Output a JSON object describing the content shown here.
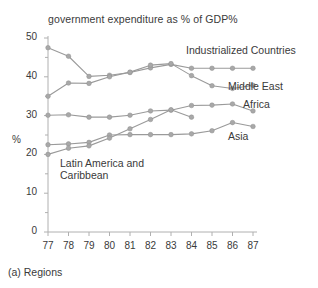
{
  "chart_data": {
    "type": "line",
    "title": "government expenditure as % of GDP%",
    "caption": "(a) Regions",
    "xlabel": "",
    "ylabel": "%",
    "x": [
      77,
      78,
      79,
      80,
      81,
      82,
      83,
      84,
      85,
      86,
      87
    ],
    "xtick_labels": [
      "77",
      "78",
      "79",
      "80",
      "81",
      "82",
      "83",
      "84",
      "85",
      "86",
      "87"
    ],
    "ytick_labels": [
      "0",
      "10",
      "20",
      "30",
      "40",
      "50"
    ],
    "yticks": [
      0,
      10,
      20,
      30,
      40,
      50
    ],
    "ylim": [
      0,
      50
    ],
    "xlim": [
      77,
      87
    ],
    "grid": false,
    "legend_position": "inline-right",
    "marker": "circle",
    "line_color": "#9a9a9a",
    "marker_color": "#a8a8a8",
    "axis_color": "#b0b0b0",
    "text_color": "#3a3a3a",
    "series": [
      {
        "name": "Industrialized Countries",
        "x": [
          77,
          78,
          79,
          80,
          81,
          82,
          83,
          84,
          85,
          86,
          87
        ],
        "values": [
          47.5,
          45.3,
          40.1,
          40.4,
          41.1,
          42.3,
          43.2,
          42.2,
          42.2,
          42.2,
          42.2
        ],
        "label_x": 87,
        "label_y": 46.5
      },
      {
        "name": "Middle East",
        "x": [
          77,
          78,
          79,
          80,
          81,
          82,
          83,
          84,
          85,
          86,
          87
        ],
        "values": [
          35.0,
          38.4,
          38.3,
          40.0,
          41.2,
          43.0,
          43.4,
          40.3,
          37.7,
          37.0,
          37.8
        ],
        "label_x": 87,
        "label_y": 38.8
      },
      {
        "name": "Africa",
        "x": [
          77,
          78,
          79,
          80,
          81,
          82,
          83,
          84,
          85,
          86,
          87
        ],
        "values": [
          30.1,
          30.2,
          29.6,
          29.6,
          30.1,
          31.2,
          31.4,
          32.6,
          32.7,
          33.0,
          31.2
        ],
        "label_x": 87,
        "label_y": 34.5
      },
      {
        "name": "Asia",
        "x": [
          77,
          78,
          79,
          80,
          81,
          82,
          83,
          84,
          85,
          86,
          87
        ],
        "values": [
          22.5,
          22.7,
          23.1,
          25.0,
          25.1,
          25.1,
          25.1,
          25.3,
          26.1,
          28.2,
          27.2
        ],
        "label_x": 87,
        "label_y": 26.2
      },
      {
        "name": "Latin America and Caribbean",
        "x": [
          77,
          78,
          79,
          80,
          81,
          82,
          83,
          84
        ],
        "values": [
          20.0,
          21.6,
          22.2,
          24.2,
          26.6,
          29.0,
          31.5,
          29.6
        ],
        "label_x": 79,
        "label_y": 18.0
      }
    ]
  }
}
